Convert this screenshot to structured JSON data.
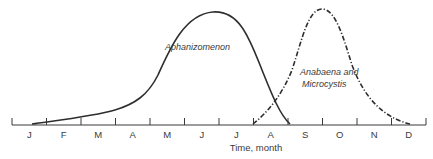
{
  "chart_data": {
    "type": "line",
    "title": "",
    "xlabel": "Time, month",
    "ylabel": "",
    "categories": [
      "J",
      "F",
      "M",
      "A",
      "M",
      "J",
      "J",
      "A",
      "S",
      "O",
      "N",
      "D"
    ],
    "grid": false,
    "legend": "inline labels",
    "series": [
      {
        "name": "Aphanizomenon",
        "style": "solid",
        "relative_abundance": [
          0.03,
          0.08,
          0.15,
          0.35,
          0.85,
          1.0,
          0.7,
          0.15,
          0.0,
          0.0,
          0.0,
          0.0
        ]
      },
      {
        "name": "Anabaena and Microcystis",
        "style": "dash-dot",
        "relative_abundance": [
          0.0,
          0.0,
          0.0,
          0.0,
          0.0,
          0.0,
          0.0,
          0.25,
          0.98,
          0.6,
          0.2,
          0.02
        ]
      }
    ]
  },
  "labels": {
    "series1": "Aphanizomenon",
    "series2_line1": "Anabaena and",
    "series2_line2": "Microcystis",
    "xlabel": "Time, month",
    "months": [
      "J",
      "F",
      "M",
      "A",
      "M",
      "J",
      "J",
      "A",
      "S",
      "O",
      "N",
      "D"
    ]
  }
}
